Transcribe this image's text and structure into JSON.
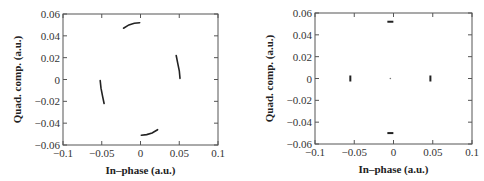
{
  "chart_data": [
    {
      "type": "scatter",
      "title": "",
      "xlabel": "In–phase (a.u.)",
      "ylabel": "Quad. comp. (a.u.)",
      "xlim": [
        -0.1,
        0.1
      ],
      "ylim": [
        -0.06,
        0.06
      ],
      "xticks": [
        "−0.1",
        "−0.05",
        "0",
        "0.05",
        "0.1"
      ],
      "yticks": [
        "0.06",
        "0.04",
        "0.02",
        "0",
        "−0.02",
        "−0.04",
        "−0.06"
      ],
      "grid": false,
      "legend": null,
      "description": "QPSK constellation with phase rotation: four short arcs",
      "series": [
        {
          "name": "top-arc",
          "x": [
            -0.022,
            -0.015,
            -0.008,
            -0.001
          ],
          "y": [
            0.047,
            0.05,
            0.0515,
            0.052
          ]
        },
        {
          "name": "right-arc",
          "x": [
            0.046,
            0.048,
            0.05,
            0.051
          ],
          "y": [
            0.022,
            0.015,
            0.008,
            0.001
          ]
        },
        {
          "name": "left-arc",
          "x": [
            -0.052,
            -0.051,
            -0.049,
            -0.047
          ],
          "y": [
            -0.001,
            -0.008,
            -0.015,
            -0.022
          ]
        },
        {
          "name": "bottom-arc",
          "x": [
            0.001,
            0.008,
            0.015,
            0.022
          ],
          "y": [
            -0.051,
            -0.0505,
            -0.049,
            -0.046
          ]
        }
      ]
    },
    {
      "type": "scatter",
      "title": "",
      "xlabel": "In–phase (a.u.)",
      "ylabel": "Quad. comp. (a.u.)",
      "xlim": [
        -0.1,
        0.1
      ],
      "ylim": [
        -0.06,
        0.06
      ],
      "xticks": [
        "−0.1",
        "−0.05",
        "0",
        "0.05",
        "0.1"
      ],
      "yticks": [
        "0.06",
        "0.04",
        "0.02",
        "0",
        "−0.02",
        "−0.04",
        "−0.06"
      ],
      "grid": false,
      "legend": null,
      "description": "QPSK constellation after correction: four tight clusters plus a faint center point",
      "series": [
        {
          "name": "clusters",
          "x": [
            -0.004,
            0.047,
            -0.055,
            -0.004
          ],
          "y": [
            0.052,
            0.0,
            0.0,
            -0.05
          ]
        },
        {
          "name": "center",
          "x": [
            -0.004
          ],
          "y": [
            0.0
          ]
        }
      ]
    }
  ],
  "colors": {
    "data": "#222222",
    "axes": "#555555",
    "text": "#333333"
  }
}
